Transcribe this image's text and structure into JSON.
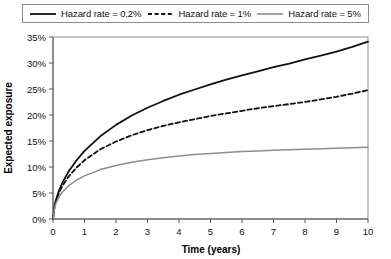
{
  "chart_data": {
    "type": "line",
    "title": "",
    "xlabel": "Time (years)",
    "ylabel": "Expected exposure",
    "xlim": [
      0,
      10
    ],
    "ylim": [
      0,
      35
    ],
    "grid": false,
    "legend_position": "top",
    "xticks": [
      "0",
      "1",
      "2",
      "3",
      "4",
      "5",
      "6",
      "7",
      "8",
      "9",
      "10"
    ],
    "xtick_values": [
      0,
      1,
      2,
      3,
      4,
      5,
      6,
      7,
      8,
      9,
      10
    ],
    "yticks": [
      "0%",
      "5%",
      "10%",
      "15%",
      "20%",
      "25%",
      "30%",
      "35%"
    ],
    "ytick_values": [
      0,
      5,
      10,
      15,
      20,
      25,
      30,
      35
    ],
    "x": [
      0,
      0.05,
      0.1,
      0.2,
      0.3,
      0.5,
      0.75,
      1,
      1.5,
      2,
      2.5,
      3,
      3.5,
      4,
      4.5,
      5,
      5.5,
      6,
      6.5,
      7,
      7.5,
      8,
      8.5,
      9,
      9.5,
      10
    ],
    "series": [
      {
        "name": "Hazard rate = 0.2%",
        "color": "#111111",
        "style": "solid",
        "width": 1.8,
        "values": [
          0,
          2.6,
          3.8,
          5.6,
          7.0,
          9.2,
          11.3,
          13.1,
          15.9,
          18.1,
          19.9,
          21.4,
          22.7,
          23.9,
          24.9,
          25.9,
          26.8,
          27.6,
          28.4,
          29.2,
          29.9,
          30.7,
          31.4,
          32.2,
          33.1,
          34.1
        ]
      },
      {
        "name": "Hazard rate = 1%",
        "color": "#111111",
        "style": "dashed",
        "width": 1.8,
        "values": [
          0,
          2.5,
          3.6,
          5.2,
          6.4,
          8.2,
          9.9,
          11.3,
          13.4,
          14.9,
          16.1,
          17.1,
          17.9,
          18.6,
          19.2,
          19.8,
          20.3,
          20.8,
          21.3,
          21.7,
          22.1,
          22.5,
          23.0,
          23.5,
          24.1,
          24.8
        ]
      },
      {
        "name": "Hazard rate = 5%",
        "color": "#8d8d8d",
        "style": "solid",
        "width": 1.5,
        "values": [
          0,
          2.2,
          3.1,
          4.3,
          5.2,
          6.4,
          7.5,
          8.3,
          9.5,
          10.3,
          10.9,
          11.4,
          11.8,
          12.1,
          12.4,
          12.6,
          12.8,
          13.0,
          13.1,
          13.2,
          13.3,
          13.4,
          13.5,
          13.6,
          13.7,
          13.8
        ]
      }
    ]
  },
  "legend": {
    "entries": [
      {
        "label": "Hazard rate = 0.2%"
      },
      {
        "label": "Hazard rate = 1%"
      },
      {
        "label": "Hazard rate = 5%"
      }
    ]
  },
  "axes": {
    "x_title": "Time (years)",
    "y_title": "Expected exposure"
  }
}
